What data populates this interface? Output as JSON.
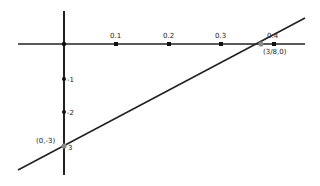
{
  "diagram": {
    "type": "coordinate-graph",
    "line": {
      "description": "line through (0,-3) and (3/8,0)",
      "color": "#222222"
    },
    "x_axis": {
      "ticks": [
        {
          "label": "0.1",
          "x": 116
        },
        {
          "label": "0.2",
          "x": 169
        },
        {
          "label": "0.3",
          "x": 221
        },
        {
          "label": "0.4",
          "x": 274
        }
      ]
    },
    "y_axis": {
      "ticks": [
        {
          "label": "-1",
          "y": 79
        },
        {
          "label": "-2",
          "y": 112
        },
        {
          "label": "3",
          "y": 146
        }
      ]
    },
    "points": {
      "x_intercept": {
        "label": "(3/8,0)",
        "color": "#888888"
      },
      "y_intercept": {
        "label": "(0,-3)",
        "color": "#888888"
      }
    },
    "colors": {
      "axis": "#222222",
      "point": "#111111",
      "intercept": "#8a8a8a"
    }
  }
}
